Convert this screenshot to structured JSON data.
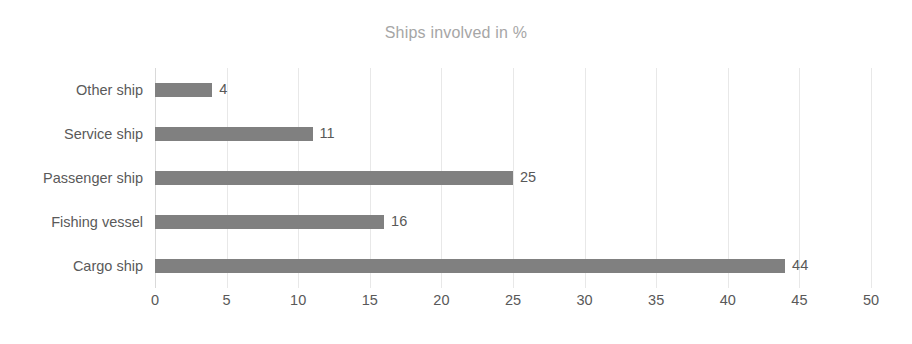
{
  "chart_data": {
    "type": "bar",
    "orientation": "horizontal",
    "title": "Ships involved in %",
    "subtitle": "",
    "xlabel": "",
    "ylabel": "",
    "categories": [
      "Other ship",
      "Service ship",
      "Passenger ship",
      "Fishing vessel",
      "Cargo ship"
    ],
    "values": [
      4,
      11,
      25,
      16,
      44
    ],
    "value_labels": [
      "4",
      "11",
      "25",
      "16",
      "44"
    ],
    "xlim": [
      0,
      50
    ],
    "xticks": [
      0,
      5,
      10,
      15,
      20,
      25,
      30,
      35,
      40,
      45,
      50
    ],
    "xtick_labels": [
      "0",
      "5",
      "10",
      "15",
      "20",
      "25",
      "30",
      "35",
      "40",
      "45",
      "50"
    ],
    "grid": true,
    "grid_axis": "x",
    "legend": false,
    "legend_position": "none",
    "series": [
      {
        "name": "Ships involved in %",
        "values": [
          4,
          11,
          25,
          16,
          44
        ]
      }
    ]
  },
  "colors": {
    "bar": "#808080",
    "background": "#ffffff",
    "gridline": "#e8e8e8",
    "axis": "#d9d9d9",
    "title_text": "#a6a6a6",
    "category_text": "#5a5a5a",
    "tick_text": "#595959",
    "value_text": "#585858"
  }
}
